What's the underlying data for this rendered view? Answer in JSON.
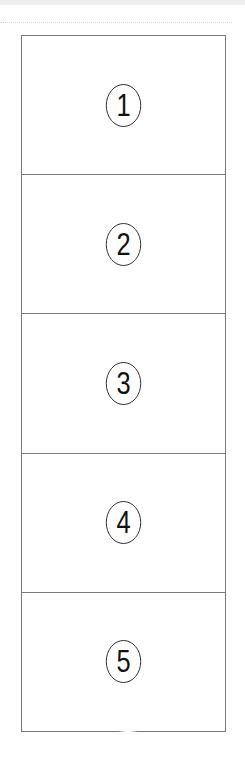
{
  "page": {
    "layout": "vertical numbered grid",
    "cell_count": 5
  },
  "grid": {
    "border_color": "#7a7a7a",
    "cells": [
      {
        "label": "①",
        "number": 1
      },
      {
        "label": "②",
        "number": 2
      },
      {
        "label": "③",
        "number": 3
      },
      {
        "label": "④",
        "number": 4
      },
      {
        "label": "⑤",
        "number": 5
      }
    ]
  },
  "numerals": [
    "1",
    "2",
    "3",
    "4",
    "5"
  ]
}
